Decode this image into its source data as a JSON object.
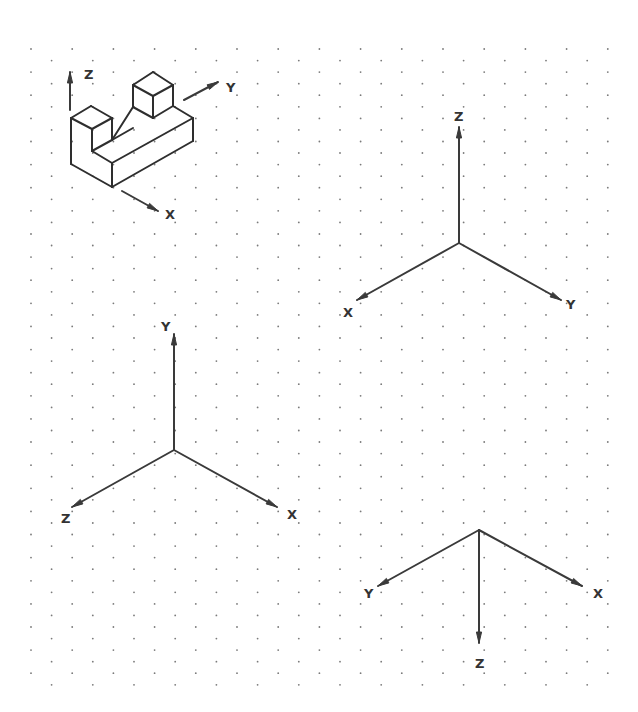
{
  "diagram": {
    "title": "",
    "type": "isometric-dot-grid-axes",
    "colors": {
      "line": "#333333",
      "dot": "#7a7a7a",
      "background": "#ffffff"
    },
    "grid": {
      "kind": "isometric-dots",
      "origin_x": 31,
      "origin_y": 49,
      "col_step": 41.2,
      "row_step": 11.56,
      "rows": 56,
      "cols": 15
    },
    "object": {
      "name": "isometric-stepped-block",
      "edges": [
        [
          [
            71,
            118
          ],
          [
            91,
            106
          ]
        ],
        [
          [
            91,
            106
          ],
          [
            112,
            118
          ]
        ],
        [
          [
            112,
            118
          ],
          [
            92,
            129
          ]
        ],
        [
          [
            92,
            129
          ],
          [
            71,
            118
          ]
        ],
        [
          [
            71,
            118
          ],
          [
            71,
            164
          ]
        ],
        [
          [
            92,
            129
          ],
          [
            92,
            151
          ]
        ],
        [
          [
            112,
            118
          ],
          [
            112,
            140
          ]
        ],
        [
          [
            92,
            151
          ],
          [
            112,
            140
          ]
        ],
        [
          [
            92,
            151
          ],
          [
            112,
            163
          ]
        ],
        [
          [
            112,
            140
          ],
          [
            133,
            128
          ]
        ],
        [
          [
            71,
            164
          ],
          [
            112,
            187
          ]
        ],
        [
          [
            112,
            187
          ],
          [
            193,
            141
          ]
        ],
        [
          [
            112,
            163
          ],
          [
            112,
            187
          ]
        ],
        [
          [
            112,
            163
          ],
          [
            193,
            118
          ]
        ],
        [
          [
            193,
            118
          ],
          [
            193,
            141
          ]
        ],
        [
          [
            173,
            106
          ],
          [
            193,
            118
          ]
        ],
        [
          [
            133,
            107
          ],
          [
            133,
            85
          ]
        ],
        [
          [
            133,
            85
          ],
          [
            153,
            72
          ]
        ],
        [
          [
            153,
            72
          ],
          [
            173,
            85
          ]
        ],
        [
          [
            173,
            85
          ],
          [
            153,
            96
          ]
        ],
        [
          [
            153,
            96
          ],
          [
            133,
            85
          ]
        ],
        [
          [
            153,
            96
          ],
          [
            153,
            118
          ]
        ],
        [
          [
            173,
            85
          ],
          [
            173,
            106
          ]
        ],
        [
          [
            173,
            106
          ],
          [
            153,
            118
          ]
        ],
        [
          [
            133,
            107
          ],
          [
            153,
            118
          ]
        ],
        [
          [
            112,
            140
          ],
          [
            133,
            107
          ]
        ]
      ],
      "axis_indicators": [
        {
          "label": "Z",
          "from": [
            70,
            110
          ],
          "to": [
            70,
            72
          ],
          "label_pos": [
            84,
            79
          ]
        },
        {
          "label": "Y",
          "from": [
            184,
            100
          ],
          "to": [
            218,
            82
          ],
          "label_pos": [
            226,
            92
          ]
        },
        {
          "label": "X",
          "from": [
            122,
            191
          ],
          "to": [
            158,
            211
          ],
          "label_pos": [
            165,
            219
          ]
        }
      ]
    },
    "axis_sets": [
      {
        "name": "axes-z-up",
        "origin": [
          459,
          243
        ],
        "axes": [
          {
            "label": "Z",
            "tip": [
              459,
              127
            ],
            "label_pos": [
              454,
              121
            ]
          },
          {
            "label": "X",
            "tip": [
              357,
              300
            ],
            "label_pos": [
              343,
              317
            ]
          },
          {
            "label": "Y",
            "tip": [
              561,
              300
            ],
            "label_pos": [
              566,
              309
            ]
          }
        ]
      },
      {
        "name": "axes-y-up",
        "origin": [
          174,
          450
        ],
        "axes": [
          {
            "label": "Y",
            "tip": [
              174,
              334
            ],
            "label_pos": [
              161,
              331
            ]
          },
          {
            "label": "Z",
            "tip": [
              72,
              507
            ],
            "label_pos": [
              61,
              523
            ]
          },
          {
            "label": "X",
            "tip": [
              277,
              507
            ],
            "label_pos": [
              287,
              519
            ]
          }
        ]
      },
      {
        "name": "axes-z-down",
        "origin": [
          479,
          530
        ],
        "axes": [
          {
            "label": "Y",
            "tip": [
              378,
              586
            ],
            "label_pos": [
              364,
              598
            ]
          },
          {
            "label": "X",
            "tip": [
              582,
              586
            ],
            "label_pos": [
              593,
              598
            ]
          },
          {
            "label": "Z",
            "tip": [
              479,
              643
            ],
            "label_pos": [
              475,
              668
            ]
          }
        ]
      }
    ]
  }
}
